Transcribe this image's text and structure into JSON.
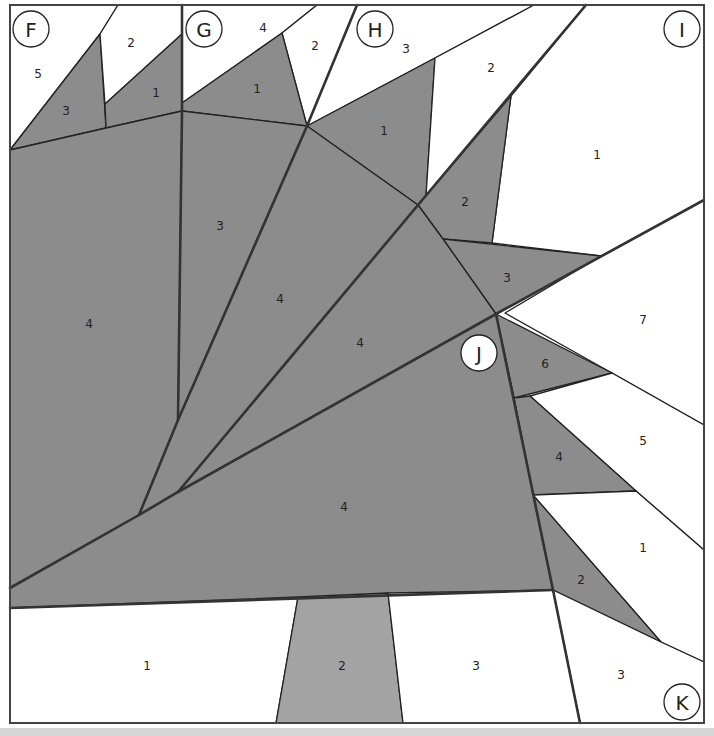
{
  "colors": {
    "dark_fabric": "#8c8c8c",
    "light_fabric": "#ffffff",
    "medium_fabric": "#a3a3a3",
    "line": "#222222",
    "border": "#444444"
  },
  "sections": [
    {
      "label": "F",
      "x": 31,
      "y": 29
    },
    {
      "label": "G",
      "x": 204,
      "y": 29
    },
    {
      "label": "H",
      "x": 375,
      "y": 29
    },
    {
      "label": "I",
      "x": 682,
      "y": 29
    },
    {
      "label": "J",
      "x": 479,
      "y": 353
    },
    {
      "label": "K",
      "x": 682,
      "y": 702
    }
  ],
  "pieces": {
    "F": [
      {
        "num": "5",
        "fill": "light",
        "points": "10,5 118,5 100,34 10,150",
        "lx": 38,
        "ly": 74
      },
      {
        "num": "3",
        "fill": "dark",
        "points": "100,34 106,128 10,150",
        "lx": 66,
        "ly": 111
      },
      {
        "num": "2",
        "fill": "light",
        "points": "118,5 182,5 182,34 105,104 100,34",
        "lx": 131,
        "ly": 43
      },
      {
        "num": "1",
        "fill": "dark",
        "points": "182,34 182,111 106,128 105,104",
        "lx": 156,
        "ly": 93
      }
    ],
    "G": [
      {
        "num": "4",
        "fill": "light",
        "points": "182,5 317,5 282,33 182,103",
        "lx": 263,
        "ly": 28
      },
      {
        "num": "2",
        "fill": "light",
        "points": "317,5 357,5 307,126 282,33",
        "lx": 315,
        "ly": 46
      },
      {
        "num": "1",
        "fill": "dark",
        "points": "182,103 282,33 307,126 182,111",
        "lx": 257,
        "ly": 89
      }
    ],
    "H": [
      {
        "num": "3",
        "fill": "light",
        "points": "357,5 534,5 435,58 307,126",
        "lx": 406,
        "ly": 49
      },
      {
        "num": "1",
        "fill": "dark",
        "points": "307,126 435,58 426,196 418,205",
        "lx": 384,
        "ly": 131
      },
      {
        "num": "2",
        "fill": "light",
        "points": "534,5 586,5 511,96 426,196 435,58",
        "lx": 491,
        "ly": 68
      }
    ],
    "I": [
      {
        "num": "1",
        "fill": "light",
        "points": "586,5 704,5 704,200 601,256 492,243 511,96",
        "lx": 597,
        "ly": 155
      },
      {
        "num": "2",
        "fill": "dark",
        "points": "418,205 511,96 492,243 443,239",
        "lx": 465,
        "ly": 202
      },
      {
        "num": "3",
        "fill": "dark",
        "points": "443,239 601,256 496,314",
        "lx": 507,
        "ly": 278
      },
      {
        "num": "7",
        "fill": "light",
        "points": "601,256 704,200 704,425 612,373 505,313",
        "lx": 643,
        "ly": 320
      }
    ],
    "J": [
      {
        "num": "6",
        "fill": "dark",
        "points": "496,314 612,373 514,398",
        "lx": 545,
        "ly": 364
      },
      {
        "num": "5",
        "fill": "light",
        "points": "612,373 704,425 704,550 636,491 530,396",
        "lx": 643,
        "ly": 441
      },
      {
        "num": "4",
        "fill": "dark",
        "points": "514,398 530,396 636,491 533,495",
        "lx": 559,
        "ly": 457
      },
      {
        "num": "1",
        "fill": "light",
        "points": "533,495 636,491 704,550 704,662 661,642",
        "lx": 643,
        "ly": 548
      },
      {
        "num": "2",
        "fill": "dark",
        "points": "533,495 661,642 553,590",
        "lx": 581,
        "ly": 580
      }
    ],
    "K": [
      {
        "num": "3",
        "fill": "light",
        "points": "553,590 661,642 704,662 704,723 580,723",
        "lx": 621,
        "ly": 675
      }
    ],
    "center": [
      {
        "num": "4",
        "fill": "dark",
        "points": "10,150 106,128 182,111 178,420 139,515 10,588",
        "lx": 89,
        "ly": 324
      },
      {
        "num": "3",
        "fill": "dark",
        "points": "182,111 307,126 178,420",
        "lx": 220,
        "ly": 226
      },
      {
        "num": "4",
        "fill": "dark",
        "points": "307,126 418,205 178,492 139,515 178,420",
        "lx": 280,
        "ly": 299
      },
      {
        "num": "4",
        "fill": "dark",
        "points": "418,205 443,239 496,314 178,492",
        "lx": 360,
        "ly": 343
      },
      {
        "num": "4",
        "fill": "dark",
        "points": "10,588 139,515 178,492 496,314 514,398 533,495 553,590 10,608",
        "lx": 344,
        "ly": 507
      }
    ],
    "bottom": [
      {
        "num": "1",
        "fill": "light",
        "points": "10,608 298,597 276,723 10,723",
        "lx": 147,
        "ly": 666
      },
      {
        "num": "2",
        "fill": "medium",
        "points": "298,597 388,593 403,723 276,723",
        "lx": 342,
        "ly": 666
      },
      {
        "num": "3",
        "fill": "light",
        "points": "388,593 553,590 580,723 403,723",
        "lx": 476,
        "ly": 666
      }
    ]
  },
  "seams": [
    "182,5 182,111 178,420",
    "357,5 307,126 178,420 139,515",
    "586,5 418,205 178,492",
    "704,200 496,314 178,492 139,515 10,588",
    "496,314 553,590 580,723",
    "10,608 553,590"
  ]
}
